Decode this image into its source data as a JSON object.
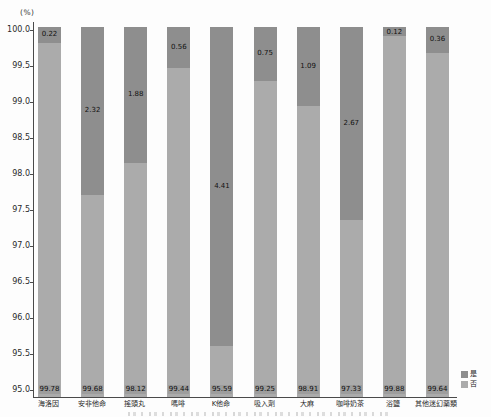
{
  "chart_data": {
    "type": "bar",
    "stacked": true,
    "title": "",
    "unit_label": "(%)",
    "xlabel": "",
    "ylabel": "(%)",
    "ylim": [
      95.0,
      100.0
    ],
    "grid": false,
    "yticks": [
      "100.0",
      "99.5",
      "99.0",
      "98.5",
      "98.0",
      "97.5",
      "97.0",
      "96.5",
      "96.0",
      "95.5",
      "95.0"
    ],
    "categories": [
      "海洛因",
      "安非他命",
      "搖頭丸",
      "嗎啡",
      "K他命",
      "吸入劑",
      "大麻",
      "咖啡奶茶",
      "浴鹽",
      "其他迷幻藥類"
    ],
    "series": [
      {
        "name": "是",
        "color": "#8e8e8e",
        "values": [
          0.22,
          2.32,
          1.88,
          0.56,
          4.41,
          0.75,
          1.09,
          2.67,
          0.12,
          0.36
        ]
      },
      {
        "name": "否",
        "color": "#ababab",
        "values": [
          99.78,
          99.68,
          98.12,
          99.44,
          95.59,
          99.25,
          98.91,
          97.33,
          99.88,
          99.64
        ]
      }
    ],
    "legend": {
      "position": "bottom-right",
      "entries": [
        "是",
        "否"
      ]
    },
    "colors": {
      "yes_segment": "#8e8e8e",
      "no_segment": "#ababab",
      "axis": "#4a4a4a",
      "value_text": "#111111",
      "background": "#fdfdfd"
    }
  }
}
